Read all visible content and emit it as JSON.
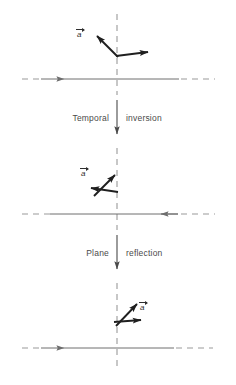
{
  "figure": {
    "type": "physics-symmetry-diagram",
    "title": "",
    "background": "#ffffff",
    "width": 236,
    "height": 385,
    "colors": {
      "dashed_line": "#9a9a9a",
      "axis_line": "#6e6e6e",
      "vector": "#1f1f1f",
      "caption_text": "#4a4a4a",
      "label_text": "#2e2e2e"
    }
  },
  "transitions": [
    {
      "id": "temporal-inversion",
      "word_left": "Temporal",
      "word_right": "inversion",
      "arrow": "down-arrow-icon",
      "x": 117,
      "text_y": 118
    },
    {
      "id": "plane-reflection",
      "word_left": "Plane",
      "word_right": "reflection",
      "arrow": "down-arrow-icon",
      "x": 117,
      "text_y": 253
    }
  ],
  "panels": [
    {
      "id": "panel-initial",
      "name": "initial-configuration",
      "mirror_plane_x": 117,
      "axis_y": 79,
      "axis": {
        "name": "horizontal-axis",
        "arrow_direction": "right",
        "arrow_x": 64,
        "dash_left_end": 22,
        "dash_left_solid_start": 40,
        "solid_right_end": 178,
        "dash_right_end": 214
      },
      "vector_label": {
        "text": "a",
        "overbar_arrow": "right",
        "x": 80,
        "y": 29
      },
      "vectors": [
        {
          "name": "vector-a-diagonal",
          "from": [
            117,
            56
          ],
          "to": [
            94,
            33
          ],
          "direction": "up-left"
        },
        {
          "name": "vector-a-horizontal",
          "from": [
            117,
            56
          ],
          "to": [
            153,
            52
          ],
          "direction": "right"
        }
      ]
    },
    {
      "id": "panel-temporal-inverted",
      "name": "after-temporal-inversion",
      "mirror_plane_x": 117,
      "axis_y": 214,
      "axis": {
        "name": "horizontal-axis",
        "arrow_direction": "left",
        "arrow_x": 165,
        "dash_left_end": 22,
        "dash_left_solid_start": 40,
        "solid_right_end": 178,
        "dash_right_end": 214
      },
      "vector_label": {
        "text": "a",
        "overbar_arrow": "right",
        "x": 84,
        "y": 168
      },
      "vectors": [
        {
          "name": "vector-a-diagonal",
          "from": [
            92,
            194
          ],
          "to": [
            115,
            171
          ],
          "direction": "up-right"
        },
        {
          "name": "vector-a-horizontal",
          "from": [
            117,
            191
          ],
          "to": [
            88,
            187
          ],
          "direction": "left"
        }
      ]
    },
    {
      "id": "panel-plane-reflected",
      "name": "after-plane-reflection",
      "mirror_plane_x": 117,
      "axis_y": 348,
      "axis": {
        "name": "horizontal-axis",
        "arrow_direction": "right",
        "arrow_x": 64,
        "dash_left_end": 22,
        "dash_left_solid_start": 40,
        "solid_right_end": 178,
        "dash_right_end": 214
      },
      "vector_label": {
        "text": "a",
        "overbar_arrow": "right",
        "x": 140,
        "y": 303
      },
      "vectors": [
        {
          "name": "vector-a-diagonal",
          "from": [
            116,
            324
          ],
          "to": [
            139,
            301
          ],
          "direction": "up-right"
        },
        {
          "name": "vector-a-horizontal",
          "from": [
            114,
            321
          ],
          "to": [
            143,
            319
          ],
          "direction": "right"
        }
      ]
    }
  ]
}
